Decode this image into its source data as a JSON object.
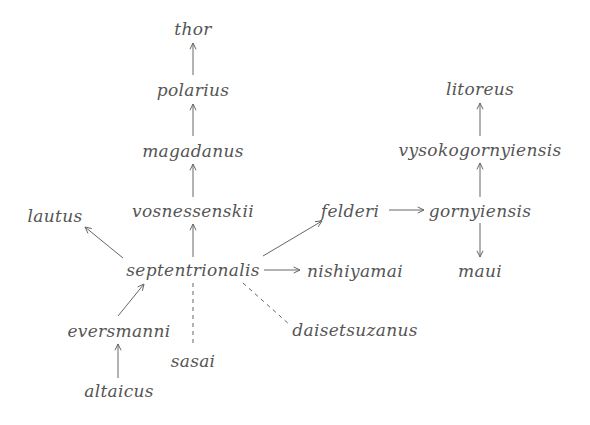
{
  "diagram": {
    "type": "phylogenetic-relationship-diagram",
    "nodes": [
      {
        "id": "thor",
        "label": "thor",
        "x": 193,
        "y": 29
      },
      {
        "id": "polarius",
        "label": "polarius",
        "x": 193,
        "y": 90
      },
      {
        "id": "magadanus",
        "label": "magadanus",
        "x": 193,
        "y": 151
      },
      {
        "id": "vosnessenskii",
        "label": "vosnessenskii",
        "x": 193,
        "y": 211
      },
      {
        "id": "lautus",
        "label": "lautus",
        "x": 55,
        "y": 216
      },
      {
        "id": "septentrionalis",
        "label": "septentrionalis",
        "x": 193,
        "y": 270
      },
      {
        "id": "felderi",
        "label": "felderi",
        "x": 350,
        "y": 211
      },
      {
        "id": "gornyiensis",
        "label": "gornyiensis",
        "x": 480,
        "y": 211
      },
      {
        "id": "vysokogornyiensis",
        "label": "vysokogornyiensis",
        "x": 480,
        "y": 150
      },
      {
        "id": "litoreus",
        "label": "litoreus",
        "x": 480,
        "y": 89
      },
      {
        "id": "maui",
        "label": "maui",
        "x": 480,
        "y": 271
      },
      {
        "id": "nishiyamai",
        "label": "nishiyamai",
        "x": 355,
        "y": 271
      },
      {
        "id": "daisetsuzanus",
        "label": "daisetsuzanus",
        "x": 355,
        "y": 330
      },
      {
        "id": "eversmanni",
        "label": "eversmanni",
        "x": 119,
        "y": 331
      },
      {
        "id": "sasai",
        "label": "sasai",
        "x": 193,
        "y": 361
      },
      {
        "id": "altaicus",
        "label": "altaicus",
        "x": 119,
        "y": 391
      }
    ],
    "edges": [
      {
        "from": "polarius",
        "to": "thor",
        "style": "solid-arrow",
        "x1": 193,
        "y1": 75,
        "x2": 193,
        "y2": 43
      },
      {
        "from": "magadanus",
        "to": "polarius",
        "style": "solid-arrow",
        "x1": 193,
        "y1": 136,
        "x2": 193,
        "y2": 104
      },
      {
        "from": "vosnessenskii",
        "to": "magadanus",
        "style": "solid-arrow",
        "x1": 193,
        "y1": 197,
        "x2": 193,
        "y2": 164
      },
      {
        "from": "septentrionalis",
        "to": "vosnessenskii",
        "style": "solid-arrow",
        "x1": 193,
        "y1": 257,
        "x2": 193,
        "y2": 224
      },
      {
        "from": "septentrionalis",
        "to": "lautus",
        "style": "solid-arrow",
        "x1": 123,
        "y1": 258,
        "x2": 85,
        "y2": 227
      },
      {
        "from": "septentrionalis",
        "to": "felderi",
        "style": "solid-arrow",
        "x1": 263,
        "y1": 256,
        "x2": 322,
        "y2": 221
      },
      {
        "from": "septentrionalis",
        "to": "nishiyamai",
        "style": "solid-arrow",
        "x1": 264,
        "y1": 270,
        "x2": 300,
        "y2": 270
      },
      {
        "from": "felderi",
        "to": "gornyiensis",
        "style": "solid-arrow",
        "x1": 389,
        "y1": 210,
        "x2": 424,
        "y2": 210
      },
      {
        "from": "gornyiensis",
        "to": "vysokogornyiensis",
        "style": "solid-arrow",
        "x1": 480,
        "y1": 197,
        "x2": 480,
        "y2": 163
      },
      {
        "from": "vysokogornyiensis",
        "to": "litoreus",
        "style": "solid-arrow",
        "x1": 480,
        "y1": 136,
        "x2": 480,
        "y2": 103
      },
      {
        "from": "gornyiensis",
        "to": "maui",
        "style": "solid-arrow",
        "x1": 480,
        "y1": 223,
        "x2": 480,
        "y2": 257
      },
      {
        "from": "eversmanni",
        "to": "septentrionalis",
        "style": "solid-arrow",
        "x1": 118,
        "y1": 316,
        "x2": 144,
        "y2": 284
      },
      {
        "from": "altaicus",
        "to": "eversmanni",
        "style": "solid-arrow",
        "x1": 118,
        "y1": 378,
        "x2": 118,
        "y2": 344
      },
      {
        "from": "septentrionalis",
        "to": "sasai",
        "style": "dashed",
        "x1": 193,
        "y1": 283,
        "x2": 193,
        "y2": 346
      },
      {
        "from": "septentrionalis",
        "to": "daisetsuzanus",
        "style": "dashed",
        "x1": 243,
        "y1": 283,
        "x2": 290,
        "y2": 325
      }
    ]
  },
  "colors": {
    "text": "#555555",
    "edge": "#666666",
    "background": "#ffffff"
  }
}
